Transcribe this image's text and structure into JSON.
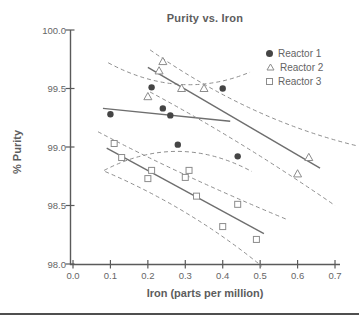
{
  "page": {
    "background": "#ffffff",
    "bottom_rule_color": "#4f4f4f"
  },
  "chart_data": {
    "type": "scatter",
    "title": "Purity vs. Iron",
    "xlabel": "Iron (parts per million)",
    "ylabel": "% Purity",
    "xlim": [
      0.0,
      0.7
    ],
    "ylim": [
      98.0,
      100.0
    ],
    "grid": false,
    "legend_position": "top-right-inside",
    "x_tick_labels": [
      "0.0",
      "0.1",
      "0.2",
      "0.3",
      "0.4",
      "0.5",
      "0.6",
      "0.7"
    ],
    "x_tick_values": [
      0.0,
      0.1,
      0.2,
      0.3,
      0.4,
      0.5,
      0.6,
      0.7
    ],
    "y_tick_labels": [
      "98.0",
      "98.5",
      "99.0",
      "99.5",
      "100.0"
    ],
    "y_tick_values": [
      98.0,
      98.5,
      99.0,
      99.5,
      100.0
    ],
    "colors": {
      "axis": "#5a5a5a",
      "text": "#666666",
      "line": "#6e6e6e",
      "dashed": "#8f8f8f",
      "marker_fill": "#454545",
      "open_marker_stroke": "#8c8c8c"
    },
    "series": [
      {
        "name": "Reactor 1",
        "marker": "filled-circle",
        "points": [
          [
            0.1,
            99.28
          ],
          [
            0.21,
            99.51
          ],
          [
            0.24,
            99.33
          ],
          [
            0.26,
            99.27
          ],
          [
            0.28,
            99.02
          ],
          [
            0.4,
            99.5
          ],
          [
            0.44,
            98.92
          ]
        ],
        "fit_line": {
          "start": [
            0.08,
            99.33
          ],
          "end": [
            0.42,
            99.22
          ]
        },
        "ci_upper": {
          "start": [
            0.094,
            99.72
          ],
          "ctrl": [
            0.286,
            99.39
          ],
          "end": [
            0.473,
            99.64
          ]
        },
        "ci_lower": {
          "start": [
            0.083,
            98.8
          ],
          "ctrl": [
            0.281,
            99.13
          ],
          "end": [
            0.478,
            98.79
          ]
        }
      },
      {
        "name": "Reactor 2",
        "marker": "open-triangle",
        "points": [
          [
            0.2,
            99.43
          ],
          [
            0.23,
            99.65
          ],
          [
            0.24,
            99.73
          ],
          [
            0.29,
            99.5
          ],
          [
            0.35,
            99.5
          ],
          [
            0.6,
            98.77
          ],
          [
            0.63,
            98.91
          ]
        ],
        "fit_line": {
          "start": [
            0.2,
            99.68
          ],
          "end": [
            0.66,
            98.82
          ]
        },
        "ci_upper": {
          "start": [
            0.206,
            99.83
          ],
          "ctrl": [
            0.473,
            99.23
          ],
          "end": [
            0.759,
            99.01
          ]
        },
        "ci_lower": {
          "start": [
            0.206,
            99.47
          ],
          "ctrl": [
            0.446,
            99.06
          ],
          "end": [
            0.7,
            98.5
          ]
        }
      },
      {
        "name": "Reactor 3",
        "marker": "open-square",
        "points": [
          [
            0.11,
            99.03
          ],
          [
            0.13,
            98.91
          ],
          [
            0.2,
            98.73
          ],
          [
            0.21,
            98.8
          ],
          [
            0.3,
            98.74
          ],
          [
            0.31,
            98.8
          ],
          [
            0.33,
            98.58
          ],
          [
            0.4,
            98.32
          ],
          [
            0.44,
            98.51
          ],
          [
            0.49,
            98.21
          ]
        ],
        "fit_line": {
          "start": [
            0.09,
            98.99
          ],
          "end": [
            0.51,
            98.26
          ]
        },
        "ci_upper": {
          "start": [
            0.067,
            99.13
          ],
          "ctrl": [
            0.286,
            98.76
          ],
          "end": [
            0.572,
            98.38
          ]
        },
        "ci_lower": {
          "start": [
            0.086,
            98.79
          ],
          "ctrl": [
            0.313,
            98.48
          ],
          "end": [
            0.505,
            97.98
          ]
        }
      }
    ]
  }
}
